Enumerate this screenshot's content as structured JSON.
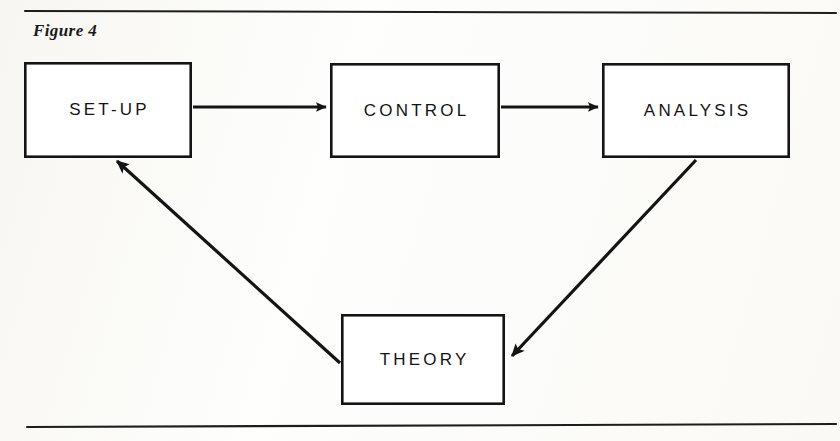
{
  "figure": {
    "caption": "Figure 4",
    "kind": "flow-diagram",
    "ink_color": "#1a1a1a",
    "paper_color": "#fdfdfb"
  },
  "rules": {
    "top": {
      "x1": 25,
      "y1": 11,
      "x2": 836,
      "y2": 13
    },
    "bottom": {
      "x1": 27,
      "y1": 427,
      "x2": 836,
      "y2": 424
    }
  },
  "nodes": [
    {
      "id": "setup",
      "label": "SET-UP",
      "x": 24,
      "y": 62,
      "w": 168,
      "h": 96
    },
    {
      "id": "control",
      "label": "CONTROL",
      "x": 330,
      "y": 63,
      "w": 170,
      "h": 95
    },
    {
      "id": "analysis",
      "label": "ANALYSIS",
      "x": 602,
      "y": 63,
      "w": 188,
      "h": 95
    },
    {
      "id": "theory",
      "label": "THEORY",
      "x": 341,
      "y": 314,
      "w": 164,
      "h": 91
    }
  ],
  "edges": [
    {
      "id": "setup-to-control",
      "from": "setup",
      "to": "control",
      "style": "horizontal",
      "x1": 193,
      "y1": 107,
      "x2": 326,
      "y2": 107
    },
    {
      "id": "control-to-analysis",
      "from": "control",
      "to": "analysis",
      "style": "horizontal",
      "x1": 501,
      "y1": 107,
      "x2": 598,
      "y2": 107
    },
    {
      "id": "analysis-to-theory",
      "from": "analysis",
      "to": "theory",
      "style": "diagonal",
      "x1": 696,
      "y1": 160,
      "x2": 512,
      "y2": 356
    },
    {
      "id": "theory-to-setup",
      "from": "theory",
      "to": "setup",
      "style": "diagonal",
      "x1": 340,
      "y1": 363,
      "x2": 117,
      "y2": 161
    }
  ]
}
